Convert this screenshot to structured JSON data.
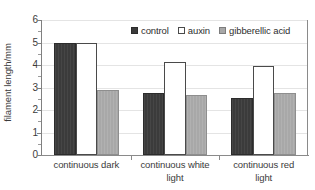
{
  "chart_data": {
    "type": "bar",
    "title": "",
    "xlabel": "",
    "ylabel": "filament length/mm",
    "ylim": [
      0,
      6
    ],
    "ytick_labels": [
      "6",
      "5",
      "4",
      "3",
      "2",
      "1",
      "0"
    ],
    "ytick_values": [
      6,
      5,
      4,
      3,
      2,
      1,
      0
    ],
    "yminor_step": 0.5,
    "grid": "horizontal",
    "legend_position": "top-right-inside",
    "categories": [
      "continuous dark",
      "continuous white light",
      "continuous red light"
    ],
    "category_label_lines": [
      [
        "continuous dark"
      ],
      [
        "continuous white",
        "light"
      ],
      [
        "continuous red",
        "light"
      ]
    ],
    "series": [
      {
        "name": "control",
        "color": "#3b3b3b",
        "values": [
          5.0,
          2.75,
          2.55
        ]
      },
      {
        "name": "auxin",
        "color": "#ffffff",
        "values": [
          5.0,
          4.15,
          3.95
        ]
      },
      {
        "name": "gibberellic acid",
        "color": "#a8a8a8",
        "values": [
          2.9,
          2.65,
          2.75
        ]
      }
    ]
  },
  "axis": {
    "y_title": "filament length/mm"
  },
  "legend": {
    "entries": [
      {
        "label": "control",
        "swatch": "dark-filled-square-icon"
      },
      {
        "label": "auxin",
        "swatch": "white-filled-square-icon"
      },
      {
        "label": "gibberellic acid",
        "swatch": "gray-filled-square-icon"
      }
    ]
  }
}
